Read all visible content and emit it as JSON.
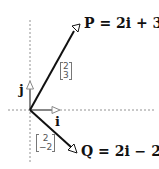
{
  "diagram": {
    "type": "vector-diagram",
    "axes": {
      "horizontal": "dashed",
      "vertical": "dashed"
    },
    "basis": {
      "i_label": "i",
      "j_label": "j",
      "color": "#888888"
    },
    "vectors": [
      {
        "name": "P",
        "equation": "P = 2i + 3j",
        "column": [
          "2",
          "3"
        ],
        "color": "#111111"
      },
      {
        "name": "Q",
        "equation": "Q = 2i − 2j",
        "column": [
          "2",
          "−2"
        ],
        "color": "#111111"
      }
    ]
  }
}
